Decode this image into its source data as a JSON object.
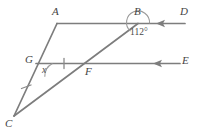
{
  "figure": {
    "type": "geometry-diagram",
    "line_color": "#7d7d7d",
    "label_color": "#444444",
    "background": "#ffffff"
  },
  "vertices": {
    "A": {
      "label": "A",
      "x": 57,
      "y": 23
    },
    "B": {
      "label": "B",
      "x": 138,
      "y": 23
    },
    "C": {
      "label": "C",
      "x": 14,
      "y": 116
    },
    "D": {
      "label": "D",
      "x": 185,
      "y": 23
    },
    "E": {
      "label": "E",
      "x": 180,
      "y": 63
    },
    "F": {
      "label": "F",
      "x": 88,
      "y": 63
    },
    "G": {
      "label": "G",
      "x": 38,
      "y": 63
    }
  },
  "angles": {
    "at_B": {
      "label": "112°",
      "value": 112,
      "unit": "degrees"
    },
    "at_G": {
      "label": "x",
      "value": null,
      "unit": "degrees"
    }
  },
  "marks": {
    "tick_on_GF": "single-tick",
    "tick_on_GC": "single-tick"
  }
}
